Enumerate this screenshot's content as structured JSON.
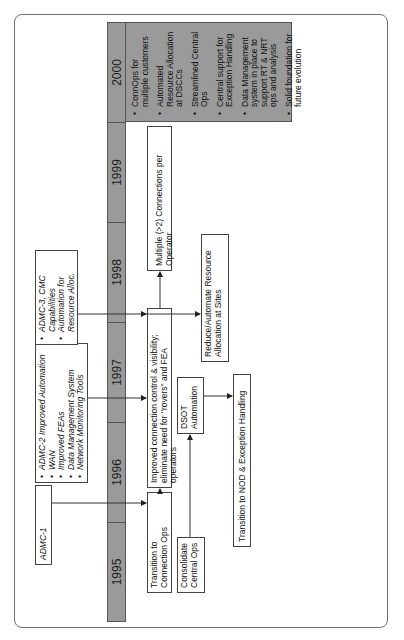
{
  "timeline": {
    "years": [
      "1995",
      "1996",
      "1997",
      "1998",
      "1999",
      "2000"
    ]
  },
  "milestones_2000": {
    "items": [
      "ConnOps for multiple customers",
      "Automated Resource Allocation at DSCCs",
      "Streamlined Central Ops",
      "Central support for Exception Handling",
      "Data Management system in place to support RT & NRT ops and analysis",
      "Solid foundation for future evolution"
    ]
  },
  "admc": {
    "admc1": {
      "label": "ADMC-1"
    },
    "admc2": {
      "items": [
        "ADMC-2 Improved Automation",
        "WAN",
        "Improved FEAs",
        "Data Management System",
        "Network Monitoring Tools"
      ]
    },
    "admc3": {
      "items": [
        "ADMC-3, CMC Capabilities",
        "Automation for Resource Alloc."
      ]
    }
  },
  "boxes": {
    "transition_connection_ops": "Transition to Connection Ops",
    "improved_connection_control": "Improved connection control & visibility; eliminate need for \"rovers\" and FEA operators",
    "multiple_connections": "Multiple (>2) Connections per Operator",
    "reduce_automate": "Reduce/Automate Resource Allocation at Sites",
    "dsot_automation": "DSOT Automation",
    "consolidate_central_ops": "Consolidate Central Ops",
    "transition_nod": "Transition to NOD & Exception Handling"
  },
  "colors": {
    "year_bar": "#9a9a9a",
    "border": "#444444",
    "frame": "#6f6f6f"
  }
}
